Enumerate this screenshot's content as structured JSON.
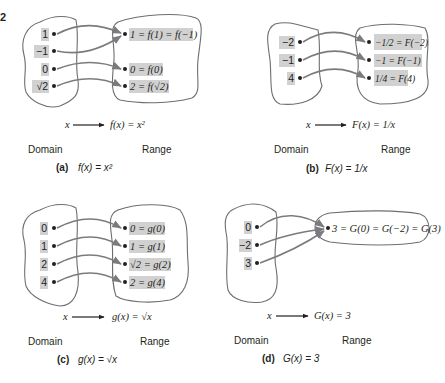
{
  "corner_mark": "2",
  "panels": [
    {
      "id": "a",
      "caption_letter": "(a)",
      "caption_formula": "f(x) = x²",
      "mapping_left": "x",
      "mapping_right": "f(x) = x²",
      "domain_label": "Domain",
      "range_label": "Range",
      "domain_values": [
        "1",
        "−1",
        "0",
        "√2"
      ],
      "range_values": [
        "1 = f(1) = f(−1)",
        "0 = f(0)",
        "2 = f(√2)"
      ],
      "arrows": [
        [
          "1",
          "1 = f(1) = f(−1)"
        ],
        [
          "−1",
          "1 = f(1) = f(−1)"
        ],
        [
          "0",
          "0 = f(0)"
        ],
        [
          "√2",
          "2 = f(√2)"
        ]
      ]
    },
    {
      "id": "b",
      "caption_letter": "(b)",
      "caption_formula": "F(x) = 1/x",
      "mapping_left": "x",
      "mapping_right": "F(x) = 1/x",
      "domain_label": "Domain",
      "range_label": "Range",
      "domain_values": [
        "−2",
        "−1",
        "4"
      ],
      "range_values": [
        "−1/2 = F(−2)",
        "−1 = F(−1)",
        "1/4 = F(4)"
      ],
      "arrows": [
        [
          "−2",
          "−1/2 = F(−2)"
        ],
        [
          "−1",
          "−1 = F(−1)"
        ],
        [
          "4",
          "1/4 = F(4)"
        ]
      ]
    },
    {
      "id": "c",
      "caption_letter": "(c)",
      "caption_formula": "g(x) = √x",
      "mapping_left": "x",
      "mapping_right": "g(x) = √x",
      "domain_label": "Domain",
      "range_label": "Range",
      "domain_values": [
        "0",
        "1",
        "2",
        "4"
      ],
      "range_values": [
        "0 = g(0)",
        "1 = g(1)",
        "√2 = g(2)",
        "2 = g(4)"
      ],
      "arrows": [
        [
          "0",
          "0 = g(0)"
        ],
        [
          "1",
          "1 = g(1)"
        ],
        [
          "2",
          "√2 = g(2)"
        ],
        [
          "4",
          "2 = g(4)"
        ]
      ]
    },
    {
      "id": "d",
      "caption_letter": "(d)",
      "caption_formula": "G(x) = 3",
      "mapping_left": "x",
      "mapping_right": "G(x) = 3",
      "domain_label": "Domain",
      "range_label": "Range",
      "domain_values": [
        "0",
        "−2",
        "3"
      ],
      "range_values": [
        "3 = G(0) = G(−2) = G(3)"
      ],
      "arrows": [
        [
          "0",
          "3 = G(0) = G(−2) = G(3)"
        ],
        [
          "−2",
          "3 = G(0) = G(−2) = G(3)"
        ],
        [
          "3",
          "3 = G(0) = G(−2) = G(3)"
        ]
      ]
    }
  ],
  "colors": {
    "highlight": "#d1d1d1",
    "arrow": "#7a7b7e",
    "outline": "#6d6e71",
    "text": "#231f20"
  }
}
